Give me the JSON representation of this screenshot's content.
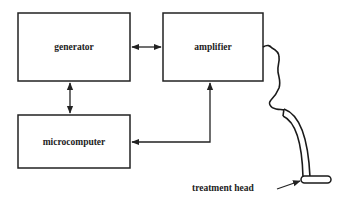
{
  "diagram": {
    "blocks": [
      {
        "id": "generator",
        "label": "generator"
      },
      {
        "id": "amplifier",
        "label": "amplifier"
      },
      {
        "id": "microcomputer",
        "label": "microcomputer"
      }
    ],
    "connections": [
      {
        "from": "generator",
        "to": "amplifier",
        "type": "bidirectional"
      },
      {
        "from": "generator",
        "to": "microcomputer",
        "type": "bidirectional"
      },
      {
        "from": "microcomputer",
        "to": "amplifier",
        "type": "bidirectional"
      },
      {
        "from": "amplifier",
        "to": "treatment head",
        "type": "cable"
      }
    ],
    "annotation": {
      "label": "treatment head"
    },
    "colors": {
      "stroke": "#222222",
      "background": "#ffffff"
    }
  }
}
